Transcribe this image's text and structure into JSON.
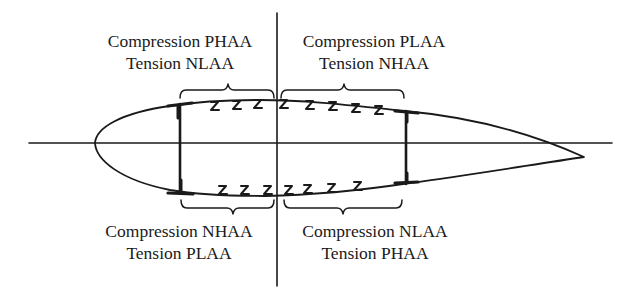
{
  "figure": {
    "type": "wing cross-section with spars and Z-stringers, quadrant load labels",
    "colors": {
      "line": "#1a1a1a",
      "background": "#ffffff"
    }
  },
  "quadrants": {
    "upper_left": {
      "line1": "Compression PHAA",
      "line2": "Tension NLAA"
    },
    "upper_right": {
      "line1": "Compression PLAA",
      "line2": "Tension NHAA"
    },
    "lower_left": {
      "line1": "Compression NHAA",
      "line2": "Tension PLAA"
    },
    "lower_right": {
      "line1": "Compression NLAA",
      "line2": "Tension PHAA"
    }
  },
  "elements": {
    "axes": [
      "horizontal-axis",
      "vertical-axis"
    ],
    "spars": [
      "front-spar",
      "rear-spar"
    ],
    "stringers_upper_count": 8,
    "stringers_lower_count": 7,
    "braces": [
      "upper-left",
      "upper-right",
      "lower-left",
      "lower-right"
    ]
  }
}
